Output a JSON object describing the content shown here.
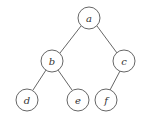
{
  "diagram": {
    "type": "binary-tree",
    "node_radius": 11,
    "nodes": [
      {
        "id": "a",
        "label": "a",
        "x": 89,
        "y": 18
      },
      {
        "id": "b",
        "label": "b",
        "x": 52,
        "y": 61
      },
      {
        "id": "c",
        "label": "c",
        "x": 124,
        "y": 61
      },
      {
        "id": "d",
        "label": "d",
        "x": 27,
        "y": 100
      },
      {
        "id": "e",
        "label": "e",
        "x": 78,
        "y": 100
      },
      {
        "id": "f",
        "label": "f",
        "x": 106,
        "y": 100
      }
    ],
    "edges": [
      {
        "from": "a",
        "to": "b"
      },
      {
        "from": "a",
        "to": "c"
      },
      {
        "from": "b",
        "to": "d"
      },
      {
        "from": "b",
        "to": "e"
      },
      {
        "from": "c",
        "to": "f"
      }
    ]
  }
}
